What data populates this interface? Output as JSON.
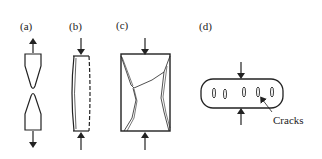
{
  "figure": {
    "panels": [
      {
        "id": "a",
        "label": "(a)",
        "description": "Tension specimen necking to fracture"
      },
      {
        "id": "b",
        "label": "(b)",
        "description": "Compression bar with barrel bulge"
      },
      {
        "id": "c",
        "label": "(c)",
        "description": "Compression block with shear fracture"
      },
      {
        "id": "d",
        "label": "(d)",
        "description": "Compressed specimen with cracks"
      }
    ],
    "annotation": {
      "text": "Cracks"
    },
    "colors": {
      "line": "#222222",
      "background": "#ffffff"
    }
  }
}
